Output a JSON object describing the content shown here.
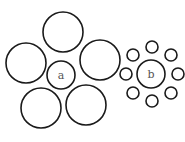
{
  "figure": {
    "left": {
      "label": "a",
      "center": {
        "cx": 61,
        "cy": 75,
        "r": 14
      },
      "surround": [
        {
          "cx": 63,
          "cy": 32,
          "r": 20
        },
        {
          "cx": 26,
          "cy": 63,
          "r": 20
        },
        {
          "cx": 100,
          "cy": 60,
          "r": 20
        },
        {
          "cx": 41,
          "cy": 108,
          "r": 20
        },
        {
          "cx": 86,
          "cy": 105,
          "r": 20
        }
      ]
    },
    "right": {
      "label": "b",
      "center": {
        "cx": 151,
        "cy": 74,
        "r": 14
      },
      "surround": [
        {
          "cx": 152,
          "cy": 47,
          "r": 6
        },
        {
          "cx": 171,
          "cy": 55,
          "r": 6
        },
        {
          "cx": 178,
          "cy": 74,
          "r": 6
        },
        {
          "cx": 171,
          "cy": 93,
          "r": 6
        },
        {
          "cx": 152,
          "cy": 101,
          "r": 6
        },
        {
          "cx": 133,
          "cy": 93,
          "r": 6
        },
        {
          "cx": 126,
          "cy": 74,
          "r": 6
        },
        {
          "cx": 133,
          "cy": 55,
          "r": 6
        }
      ]
    }
  }
}
